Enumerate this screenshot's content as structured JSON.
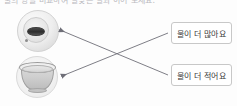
{
  "worksheet": {
    "header_text": "물의 양을 비교하여 알맞은 말과 이어 보세요.",
    "left_items": [
      {
        "id": "bowl-top",
        "icon": "bowl-top-view-photo",
        "description": "위에서 본 그릇"
      },
      {
        "id": "bowl-bottom",
        "icon": "bowl-side-view-photo",
        "description": "옆에서 본 그릇"
      }
    ],
    "answers": [
      {
        "id": "more-water",
        "label": "물이 더 많아요"
      },
      {
        "id": "less-water",
        "label": "물이 더 적어요"
      }
    ],
    "connections": [
      {
        "from": "bowl-top",
        "to": "less-water"
      },
      {
        "from": "bowl-bottom",
        "to": "more-water"
      }
    ],
    "colors": {
      "line": "#6f6f78",
      "box_border": "#c8c8c8",
      "text": "#3a3a3a",
      "background": "#fdfdfd"
    }
  }
}
